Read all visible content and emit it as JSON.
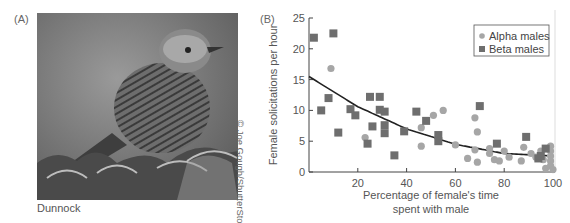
{
  "panel_a": {
    "label": "(A)",
    "caption": "Dunnock",
    "credit": "© Joe Gough/ShutterStock.com",
    "image_description": "grayscale photo of a dunnock bird perched on a shrub"
  },
  "panel_b": {
    "label": "(B)"
  },
  "chart_data": {
    "type": "scatter",
    "title": "",
    "xlabel": "Percentage of female's time spent with male",
    "xlabel_lines": [
      "Percentage of female's time",
      "spent with male"
    ],
    "ylabel": "Female solicitations per hour",
    "xlim": [
      0,
      100
    ],
    "ylim": [
      0,
      25
    ],
    "xticks": [
      20,
      40,
      60,
      80,
      100
    ],
    "yticks": [
      0,
      5,
      10,
      15,
      20,
      25
    ],
    "grid": false,
    "legend_position": "upper right",
    "series": [
      {
        "name": "Alpha males",
        "marker": "circle",
        "color": "#a6a6a6",
        "points": [
          [
            9,
            16.8
          ],
          [
            23,
            5.6
          ],
          [
            46,
            7.2
          ],
          [
            46,
            4.2
          ],
          [
            51,
            9.2
          ],
          [
            55,
            10
          ],
          [
            60,
            4.4
          ],
          [
            65,
            2.2
          ],
          [
            68,
            8.8
          ],
          [
            68,
            3.6
          ],
          [
            69,
            6.5
          ],
          [
            69,
            1.6
          ],
          [
            74,
            3.8
          ],
          [
            74,
            3
          ],
          [
            76,
            2
          ],
          [
            78,
            1.8
          ],
          [
            80,
            3.4
          ],
          [
            82,
            2.4
          ],
          [
            87,
            1.8
          ],
          [
            88,
            4
          ],
          [
            91,
            3
          ],
          [
            93,
            2.4
          ],
          [
            95,
            3.4
          ],
          [
            96,
            2
          ],
          [
            97,
            0.6
          ],
          [
            99,
            4.2
          ],
          [
            99,
            3.4
          ],
          [
            99,
            2.6
          ],
          [
            99,
            1.8
          ],
          [
            99,
            1
          ],
          [
            100,
            0.4
          ]
        ]
      },
      {
        "name": "Beta males",
        "marker": "square",
        "color": "#6e6e6e",
        "points": [
          [
            2,
            21.8
          ],
          [
            5,
            10
          ],
          [
            8,
            12
          ],
          [
            10,
            22.5
          ],
          [
            12,
            6.4
          ],
          [
            17,
            10.2
          ],
          [
            19,
            9.2
          ],
          [
            24,
            4.6
          ],
          [
            25,
            12.2
          ],
          [
            26,
            7.4
          ],
          [
            29,
            12.2
          ],
          [
            29,
            10.1
          ],
          [
            31,
            9.8
          ],
          [
            31,
            7.6
          ],
          [
            31,
            6.3
          ],
          [
            35,
            2.7
          ],
          [
            39,
            6.6
          ],
          [
            44,
            9.8
          ],
          [
            48,
            8.3
          ],
          [
            53,
            5
          ],
          [
            53,
            6
          ],
          [
            70,
            10.7
          ],
          [
            77,
            4.6
          ],
          [
            89,
            5.7
          ],
          [
            94,
            2.2
          ],
          [
            95,
            2.6
          ],
          [
            97,
            3.8
          ]
        ]
      }
    ],
    "trend_line": {
      "type": "polynomial fit",
      "points": [
        [
          0,
          15.5
        ],
        [
          20,
          10.6
        ],
        [
          40,
          7.0
        ],
        [
          60,
          4.5
        ],
        [
          80,
          3.0
        ],
        [
          100,
          2.6
        ]
      ]
    }
  }
}
